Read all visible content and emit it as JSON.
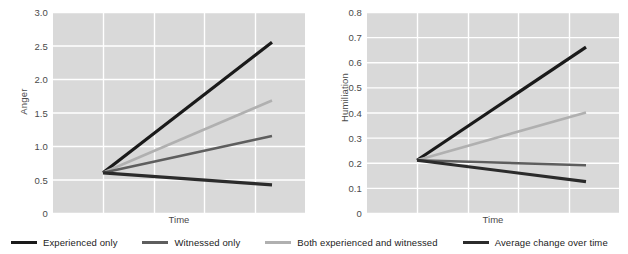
{
  "legend": {
    "items": [
      {
        "label": "Experienced only",
        "color": "#1a1a1a",
        "key": "experienced_only"
      },
      {
        "label": "Witnessed only",
        "color": "#5e5e5e",
        "key": "witnessed_only"
      },
      {
        "label": "Both experienced and witnessed",
        "color": "#b0b0b0",
        "key": "both"
      },
      {
        "label": "Average change over time",
        "color": "#2b2b2b",
        "key": "average"
      }
    ]
  },
  "chart_data": [
    {
      "type": "line",
      "panel": "left",
      "title": "",
      "xlabel": "Time",
      "ylabel": "Anger",
      "ylim": [
        0,
        3.0
      ],
      "yticks": [
        0,
        0.5,
        1.0,
        1.5,
        2.0,
        2.5,
        3.0
      ],
      "ytick_labels": [
        "0",
        "0.5",
        "1.0",
        "1.5",
        "2.0",
        "2.5",
        "3.0"
      ],
      "xlim": [
        0,
        1
      ],
      "xticks": [],
      "xtick_labels": [],
      "grid": true,
      "grid_color": "#ffffff",
      "plot_bg": "#d9d9d9",
      "x": [
        0,
        1
      ],
      "series": [
        {
          "name": "Experienced only",
          "color": "#1a1a1a",
          "width": 3.2,
          "values": [
            0.6,
            2.55
          ]
        },
        {
          "name": "Both experienced and witnessed",
          "color": "#b0b0b0",
          "width": 2.6,
          "values": [
            0.6,
            1.68
          ]
        },
        {
          "name": "Witnessed only",
          "color": "#5e5e5e",
          "width": 2.6,
          "values": [
            0.6,
            1.15
          ]
        },
        {
          "name": "Average change over time",
          "color": "#2b2b2b",
          "width": 3.2,
          "values": [
            0.6,
            0.42
          ]
        }
      ]
    },
    {
      "type": "line",
      "panel": "right",
      "title": "",
      "xlabel": "Time",
      "ylabel": "Humiliation",
      "ylim": [
        0,
        0.8
      ],
      "yticks": [
        0,
        0.1,
        0.2,
        0.3,
        0.4,
        0.5,
        0.6,
        0.7,
        0.8
      ],
      "ytick_labels": [
        "0",
        "0.1",
        "0.2",
        "0.3",
        "0.4",
        "0.5",
        "0.6",
        "0.7",
        "0.8"
      ],
      "xlim": [
        0,
        1
      ],
      "xticks": [],
      "xtick_labels": [],
      "grid": true,
      "grid_color": "#ffffff",
      "plot_bg": "#d9d9d9",
      "x": [
        0,
        1
      ],
      "series": [
        {
          "name": "Experienced only",
          "color": "#1a1a1a",
          "width": 3.2,
          "values": [
            0.21,
            0.66
          ]
        },
        {
          "name": "Both experienced and witnessed",
          "color": "#b0b0b0",
          "width": 2.6,
          "values": [
            0.21,
            0.4
          ]
        },
        {
          "name": "Witnessed only",
          "color": "#5e5e5e",
          "width": 2.6,
          "values": [
            0.21,
            0.19
          ]
        },
        {
          "name": "Average change over time",
          "color": "#2b2b2b",
          "width": 3.2,
          "values": [
            0.21,
            0.125
          ]
        }
      ]
    }
  ]
}
